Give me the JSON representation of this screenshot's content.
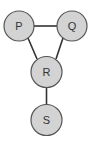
{
  "diagram": {
    "type": "graph",
    "nodes": [
      {
        "id": "P",
        "label": "P",
        "cx": 19,
        "cy": 26,
        "r": 15
      },
      {
        "id": "Q",
        "label": "Q",
        "cx": 72,
        "cy": 26,
        "r": 15
      },
      {
        "id": "R",
        "label": "R",
        "cx": 46.5,
        "cy": 72,
        "r": 15.5
      },
      {
        "id": "S",
        "label": "S",
        "cx": 46.5,
        "cy": 120,
        "r": 15.5
      }
    ],
    "edges": [
      {
        "from": "P",
        "to": "Q"
      },
      {
        "from": "P",
        "to": "R"
      },
      {
        "from": "Q",
        "to": "R"
      },
      {
        "from": "R",
        "to": "S"
      }
    ],
    "colors": {
      "node_fill": "#d3d3d3",
      "node_stroke": "#555555",
      "edge": "#333333",
      "label": "#333333"
    }
  }
}
